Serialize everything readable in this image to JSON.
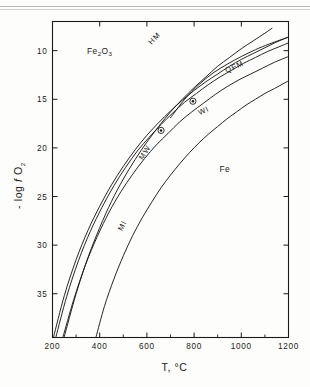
{
  "figure": {
    "top_rule": "horizontal-rule",
    "background": "#fdfdfb",
    "ink": "#1a1a1a"
  },
  "chart_data": {
    "type": "line",
    "title": "",
    "xlabel": "T, °C",
    "ylabel": "- log  f O₂",
    "ylabel_parts": {
      "prefix": "- log",
      "f": "f",
      "o": "O",
      "sub": "2"
    },
    "xlim": [
      200,
      1200
    ],
    "ylim": [
      39.5,
      7.0
    ],
    "y_inverted": true,
    "grid": false,
    "legend": "none (curves labelled in-place)",
    "xticks": [
      200,
      400,
      600,
      800,
      1000,
      1200
    ],
    "xtick_labels": [
      "200",
      "400",
      "600",
      "800",
      "1000",
      "1200"
    ],
    "xminor_ticks": [
      300,
      500,
      700,
      900,
      1100
    ],
    "yticks": [
      10,
      15,
      20,
      25,
      30,
      35
    ],
    "ytick_labels": [
      "10",
      "15",
      "20",
      "25",
      "30",
      "35"
    ],
    "field_labels": [
      {
        "name": "hematite-field",
        "text": "Fe2O3",
        "display": "Fe₂O₃",
        "x": 400,
        "y": 10.3
      },
      {
        "name": "iron-field",
        "text": "Fe",
        "display": "Fe",
        "x": 930,
        "y": 22.5
      }
    ],
    "annotations": [
      {
        "name": "marker-a",
        "symbol": "ⓐ",
        "x": 795,
        "y": 15.2,
        "note": "circled point on upper buffer"
      },
      {
        "name": "marker-b",
        "symbol": "ⓑ",
        "x": 660,
        "y": 18.2,
        "note": "circled point on lower buffer"
      }
    ],
    "series": [
      {
        "name": "HM",
        "label": "HM",
        "description": "hematite–magnetite buffer",
        "label_pos": {
          "x": 640,
          "y": 8.9,
          "rotate": -46
        },
        "points": [
          [
            250,
            39.4
          ],
          [
            300,
            35.0
          ],
          [
            350,
            31.3
          ],
          [
            400,
            28.2
          ],
          [
            450,
            25.5
          ],
          [
            500,
            23.2
          ],
          [
            550,
            21.2
          ],
          [
            600,
            19.4
          ],
          [
            650,
            17.8
          ],
          [
            700,
            16.3
          ],
          [
            750,
            15.0
          ],
          [
            800,
            13.8
          ],
          [
            850,
            12.7
          ],
          [
            900,
            11.6
          ],
          [
            950,
            10.7
          ],
          [
            1000,
            9.8
          ],
          [
            1050,
            9.0
          ],
          [
            1100,
            8.2
          ],
          [
            1130,
            7.7
          ]
        ]
      },
      {
        "name": "QFM",
        "label": "QFM",
        "description": "quartz–fayalite–magnetite buffer",
        "label_pos": {
          "x": 975,
          "y": 11.9,
          "rotate": -24
        },
        "points": [
          [
            205,
            39.4
          ],
          [
            250,
            35.2
          ],
          [
            300,
            31.5
          ],
          [
            350,
            28.5
          ],
          [
            400,
            26.0
          ],
          [
            450,
            23.8
          ],
          [
            500,
            21.9
          ],
          [
            550,
            20.2
          ],
          [
            600,
            18.7
          ],
          [
            650,
            17.4
          ],
          [
            700,
            16.2
          ],
          [
            750,
            15.1
          ],
          [
            800,
            14.1
          ],
          [
            850,
            13.2
          ],
          [
            900,
            12.4
          ],
          [
            950,
            11.6
          ],
          [
            1000,
            10.9
          ],
          [
            1050,
            10.3
          ],
          [
            1100,
            9.7
          ],
          [
            1150,
            9.1
          ],
          [
            1200,
            8.6
          ]
        ]
      },
      {
        "name": "MW",
        "label": "MW",
        "description": "magnetite–wüstite buffer",
        "label_pos": {
          "x": 600,
          "y": 20.6,
          "rotate": -58
        },
        "points": [
          [
            215,
            39.4
          ],
          [
            260,
            35.3
          ],
          [
            310,
            31.6
          ],
          [
            360,
            28.6
          ],
          [
            410,
            26.1
          ],
          [
            460,
            23.9
          ],
          [
            510,
            22.0
          ],
          [
            560,
            20.3
          ],
          [
            610,
            18.9
          ],
          [
            660,
            17.6
          ],
          [
            710,
            16.4
          ],
          [
            760,
            15.3
          ],
          [
            810,
            14.4
          ],
          [
            860,
            13.5
          ],
          [
            910,
            12.7
          ],
          [
            960,
            12.0
          ],
          [
            1010,
            11.3
          ],
          [
            1060,
            10.7
          ],
          [
            1110,
            10.1
          ],
          [
            1160,
            9.6
          ],
          [
            1200,
            9.2
          ]
        ]
      },
      {
        "name": "WI",
        "label": "WI",
        "description": "wüstite–iron buffer",
        "label_pos": {
          "x": 845,
          "y": 16.4,
          "rotate": -26
        },
        "points": [
          [
            245,
            39.4
          ],
          [
            290,
            35.6
          ],
          [
            340,
            32.0
          ],
          [
            390,
            29.1
          ],
          [
            440,
            26.6
          ],
          [
            490,
            24.5
          ],
          [
            540,
            22.7
          ],
          [
            590,
            21.1
          ],
          [
            640,
            19.7
          ],
          [
            690,
            18.5
          ],
          [
            740,
            17.3
          ],
          [
            790,
            16.3
          ],
          [
            840,
            15.4
          ],
          [
            890,
            14.5
          ],
          [
            940,
            13.7
          ],
          [
            990,
            13.0
          ],
          [
            1040,
            12.4
          ],
          [
            1090,
            11.8
          ],
          [
            1140,
            11.2
          ],
          [
            1200,
            10.6
          ]
        ]
      },
      {
        "name": "MI",
        "label": "MI",
        "description": "magnetite–iron buffer",
        "label_pos": {
          "x": 505,
          "y": 28.1,
          "rotate": -64
        },
        "points": [
          [
            385,
            39.4
          ],
          [
            420,
            36.3
          ],
          [
            460,
            33.5
          ],
          [
            500,
            31.1
          ],
          [
            540,
            29.0
          ],
          [
            580,
            27.2
          ],
          [
            620,
            25.6
          ],
          [
            660,
            24.1
          ],
          [
            700,
            22.8
          ],
          [
            740,
            21.6
          ],
          [
            780,
            20.5
          ],
          [
            820,
            19.5
          ],
          [
            860,
            18.6
          ],
          [
            900,
            17.8
          ],
          [
            940,
            17.0
          ],
          [
            980,
            16.3
          ],
          [
            1020,
            15.6
          ],
          [
            1060,
            15.0
          ],
          [
            1100,
            14.4
          ],
          [
            1140,
            13.9
          ],
          [
            1200,
            13.1
          ]
        ]
      },
      {
        "name": "MW-upper-branch",
        "label": "",
        "description": "upper magnetite-wüstite / merged branch running just above MW at high T",
        "label_pos": null,
        "points": [
          [
            700,
            16.9
          ],
          [
            760,
            15.0
          ],
          [
            820,
            13.5
          ],
          [
            880,
            12.3
          ],
          [
            940,
            11.4
          ],
          [
            1000,
            10.6
          ],
          [
            1060,
            9.9
          ],
          [
            1120,
            9.3
          ],
          [
            1200,
            8.6
          ]
        ]
      }
    ]
  }
}
